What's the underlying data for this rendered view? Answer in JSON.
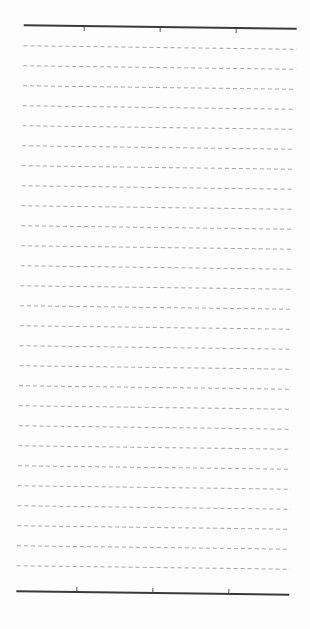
{
  "document": {
    "type": "ruled-sheet",
    "background_color": "#fdfdfd",
    "top_rule": {
      "x": 20,
      "y": 26,
      "width": 273,
      "color": "#3a3a3a",
      "tick_xs": [
        80,
        156,
        232
      ]
    },
    "bottom_rule": {
      "x": 20,
      "y": 592,
      "width": 273,
      "color": "#3a3a3a",
      "tick_xs": [
        80,
        156,
        232
      ]
    },
    "dashed_lines": {
      "count": 27,
      "first_y": 47,
      "spacing": 20,
      "x": 20,
      "width": 273,
      "color": "#a6a6a6"
    }
  }
}
